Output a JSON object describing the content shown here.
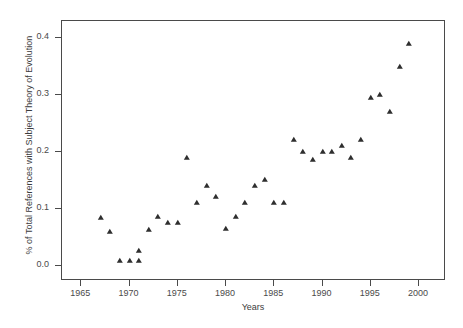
{
  "figure": {
    "clipped_title": "",
    "background_color": "#ffffff",
    "marker_color": "#2e2e2e",
    "axis_color": "#4a4a4a"
  },
  "axes": {
    "xlabel": "Years",
    "ylabel": "% of Total References with Subject Theory of Evolution",
    "xticks": [
      "1965",
      "1970",
      "1975",
      "1980",
      "1985",
      "1990",
      "1995",
      "2000"
    ],
    "yticks": [
      "0.0",
      "0.1",
      "0.2",
      "0.3",
      "0.4"
    ]
  },
  "chart_data": {
    "type": "scatter",
    "title": "",
    "xlabel": "Years",
    "ylabel": "% of Total References with Subject Theory of Evolution",
    "xlim": [
      1963.0,
      2002.8
    ],
    "ylim": [
      -0.027,
      0.43
    ],
    "xticks": [
      1965,
      1970,
      1975,
      1980,
      1985,
      1990,
      1995,
      2000
    ],
    "yticks": [
      0.0,
      0.1,
      0.2,
      0.3,
      0.4
    ],
    "grid": false,
    "legend": null,
    "marker": "triangle",
    "series": [
      {
        "name": "% of Total References with Subject Theory of Evolution",
        "points": [
          {
            "x": 1967,
            "y": 0.084
          },
          {
            "x": 1968,
            "y": 0.06
          },
          {
            "x": 1969,
            "y": 0.008
          },
          {
            "x": 1970,
            "y": 0.008
          },
          {
            "x": 1971,
            "y": 0.008
          },
          {
            "x": 1971,
            "y": 0.025
          },
          {
            "x": 1972,
            "y": 0.062
          },
          {
            "x": 1973,
            "y": 0.085
          },
          {
            "x": 1974,
            "y": 0.075
          },
          {
            "x": 1975,
            "y": 0.075
          },
          {
            "x": 1976,
            "y": 0.19
          },
          {
            "x": 1977,
            "y": 0.11
          },
          {
            "x": 1978,
            "y": 0.14
          },
          {
            "x": 1979,
            "y": 0.12
          },
          {
            "x": 1980,
            "y": 0.065
          },
          {
            "x": 1981,
            "y": 0.085
          },
          {
            "x": 1982,
            "y": 0.11
          },
          {
            "x": 1983,
            "y": 0.14
          },
          {
            "x": 1984,
            "y": 0.15
          },
          {
            "x": 1985,
            "y": 0.11
          },
          {
            "x": 1986,
            "y": 0.11
          },
          {
            "x": 1987,
            "y": 0.22
          },
          {
            "x": 1988,
            "y": 0.2
          },
          {
            "x": 1989,
            "y": 0.185
          },
          {
            "x": 1990,
            "y": 0.2
          },
          {
            "x": 1991,
            "y": 0.2
          },
          {
            "x": 1992,
            "y": 0.21
          },
          {
            "x": 1993,
            "y": 0.19
          },
          {
            "x": 1994,
            "y": 0.22
          },
          {
            "x": 1995,
            "y": 0.295
          },
          {
            "x": 1996,
            "y": 0.3
          },
          {
            "x": 1997,
            "y": 0.27
          },
          {
            "x": 1998,
            "y": 0.35
          },
          {
            "x": 1999,
            "y": 0.39
          }
        ]
      }
    ]
  }
}
